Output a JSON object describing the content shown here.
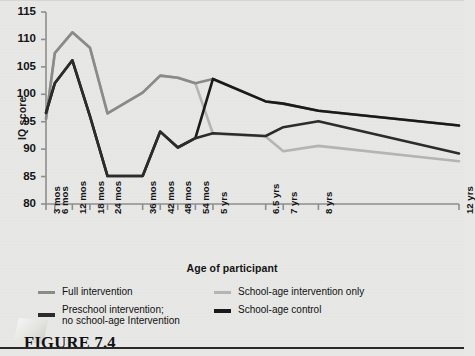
{
  "figure": {
    "caption": "FIGURE 7.4"
  },
  "chart_data": {
    "type": "line",
    "title": "",
    "xlabel": "Age of participant",
    "ylabel": "IQ score",
    "ylim": [
      80,
      115
    ],
    "yticks": [
      80,
      85,
      90,
      95,
      100,
      105,
      110,
      115
    ],
    "grid": false,
    "legend_position": "bottom",
    "categories": [
      "3 mos",
      "6 mos",
      "12 mos",
      "18 mos",
      "24 mos",
      "36 mos",
      "42 mos",
      "48 mos",
      "54 mos",
      "5 yrs",
      "6.5 yrs",
      "7 yrs",
      "8 yrs",
      "12 yrs"
    ],
    "x_positions_months": [
      3,
      6,
      12,
      18,
      24,
      36,
      42,
      48,
      54,
      60,
      78,
      84,
      96,
      144
    ],
    "series": [
      {
        "name": "Full intervention",
        "color": "#8a8a8a",
        "width": 2.6,
        "values": [
          95.5,
          107.5,
          111.3,
          108.5,
          96.5,
          100.3,
          103.4,
          103.0,
          102.0,
          102.8,
          98.7,
          98.3,
          97.0,
          94.3
        ]
      },
      {
        "name": "School-age intervention only",
        "color": "#b4b4b4",
        "width": 2.6,
        "values": [
          95.5,
          107.5,
          111.3,
          108.5,
          96.5,
          100.3,
          103.4,
          103.0,
          102.0,
          92.8,
          92.3,
          89.6,
          90.6,
          87.8
        ]
      },
      {
        "name": "Preschool intervention;\nno school-age intervention",
        "color": "#2c2c2c",
        "width": 2.6,
        "values": [
          96.6,
          102.0,
          106.2,
          96.0,
          85.1,
          85.1,
          93.2,
          90.3,
          92.0,
          92.9,
          92.4,
          94.0,
          95.1,
          89.2
        ]
      },
      {
        "name": "School-age control",
        "color": "#1a1a1a",
        "width": 2.6,
        "values": [
          96.6,
          102.0,
          106.2,
          96.0,
          85.1,
          85.1,
          93.2,
          90.3,
          92.0,
          102.8,
          98.7,
          98.3,
          97.0,
          94.3
        ]
      }
    ]
  },
  "legend": [
    {
      "label": "Full intervention",
      "color": "#8a8a8a",
      "thick": 3
    },
    {
      "label": "School-age intervention only",
      "color": "#b4b4b4",
      "thick": 3
    },
    {
      "label": "Preschool intervention;\nno school-age Intervention",
      "color": "#2c2c2c",
      "thick": 4
    },
    {
      "label": "School-age control",
      "color": "#1a1a1a",
      "thick": 4
    }
  ]
}
